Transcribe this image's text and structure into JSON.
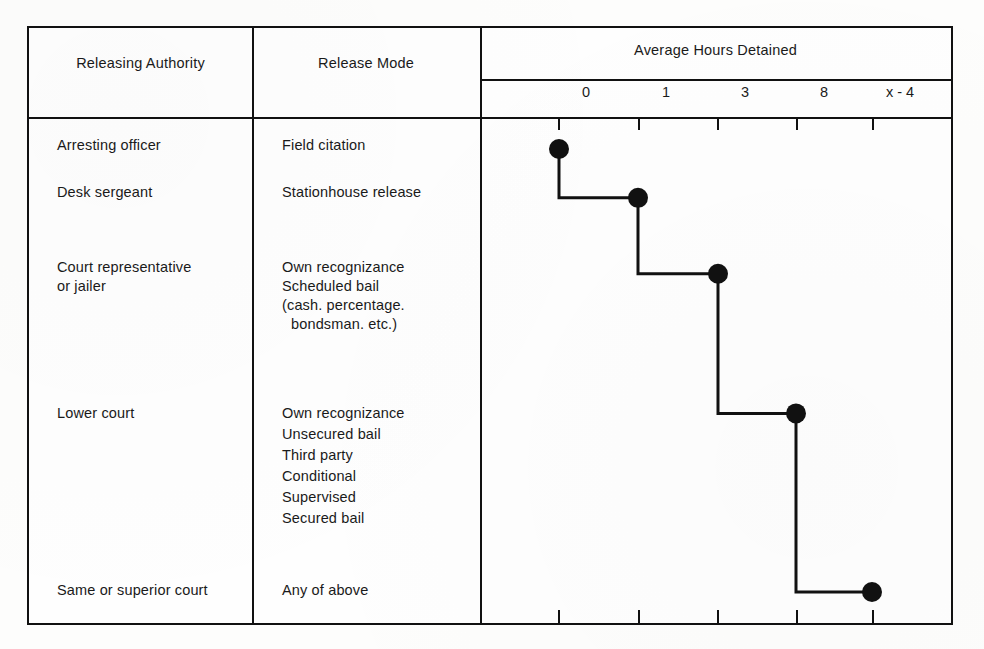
{
  "figure": {
    "columns": {
      "authority_header": "Releasing Authority",
      "mode_header": "Release Mode",
      "chart_header": "Average Hours Detained"
    },
    "rows": [
      {
        "authority": "Arresting officer",
        "mode_lines": [
          "Field citation"
        ],
        "value_label": "0"
      },
      {
        "authority": "Desk sergeant",
        "mode_lines": [
          "Stationhouse release"
        ],
        "value_label": "1"
      },
      {
        "authority": "Court representative\nor jailer",
        "mode_lines": [
          "Own recognizance",
          "Scheduled bail",
          "(cash. percentage.",
          "bondsman. etc.)"
        ],
        "value_label": "3"
      },
      {
        "authority": "Lower court",
        "mode_lines": [
          "Own recognizance",
          "Unsecured bail",
          "Third party",
          "Conditional",
          "Supervised",
          "Secured bail"
        ],
        "value_label": "8"
      },
      {
        "authority": "Same or superior court",
        "mode_lines": [
          "Any of above"
        ],
        "value_label": "x - 4"
      }
    ],
    "authority_text": {
      "r1": "Arresting officer",
      "r2": "Desk sergeant",
      "r3_line1": "Court representative",
      "r3_line2": "or jailer",
      "r4": "Lower court",
      "r5": "Same or superior court"
    },
    "mode_text": {
      "r1_l1": "Field citation",
      "r2_l1": "Stationhouse release",
      "r3_l1": "Own recognizance",
      "r3_l2": "Scheduled bail",
      "r3_l3": "(cash. percentage.",
      "r3_l4": "bondsman. etc.)",
      "r4_l1": "Own recognizance",
      "r4_l2": "Unsecured bail",
      "r4_l3": "Third party",
      "r4_l4": "Conditional",
      "r4_l5": "Supervised",
      "r4_l6": "Secured bail",
      "r5_l1": "Any of above"
    },
    "colors": {
      "ink": "#111111",
      "paper": "#fefefe",
      "page": "#fdfdfc"
    }
  },
  "chart_data": {
    "type": "line",
    "title": "Average Hours Detained",
    "xlabel": "",
    "ylabel": "",
    "orientation": "horizontal-step",
    "grid": false,
    "legend": null,
    "axis_position": "top-and-bottom",
    "tick_labels": [
      "0",
      "1",
      "3",
      "8",
      "x - 4"
    ],
    "tick_x_px": [
      557,
      637,
      716,
      795,
      871
    ],
    "categories": [
      "Arresting officer / Field citation",
      "Desk sergeant / Stationhouse release",
      "Court representative or jailer / Own recognizance, Scheduled bail",
      "Lower court / Own recognizance, Unsecured bail, Third party, Conditional, Supervised, Secured bail",
      "Same or superior court / Any of above"
    ],
    "values": [
      0,
      1,
      3,
      8,
      "x - 4"
    ],
    "points": [
      {
        "label": "0",
        "x_px": 557,
        "y_px": 147
      },
      {
        "label": "1",
        "x_px": 636,
        "y_px": 196
      },
      {
        "label": "3",
        "x_px": 716,
        "y_px": 272
      },
      {
        "label": "8",
        "x_px": 794,
        "y_px": 412
      },
      {
        "label": "x - 4",
        "x_px": 870,
        "y_px": 591
      }
    ],
    "marker": "filled-circle",
    "marker_color": "#111111",
    "line_color": "#111111",
    "line_width_px": 3
  }
}
